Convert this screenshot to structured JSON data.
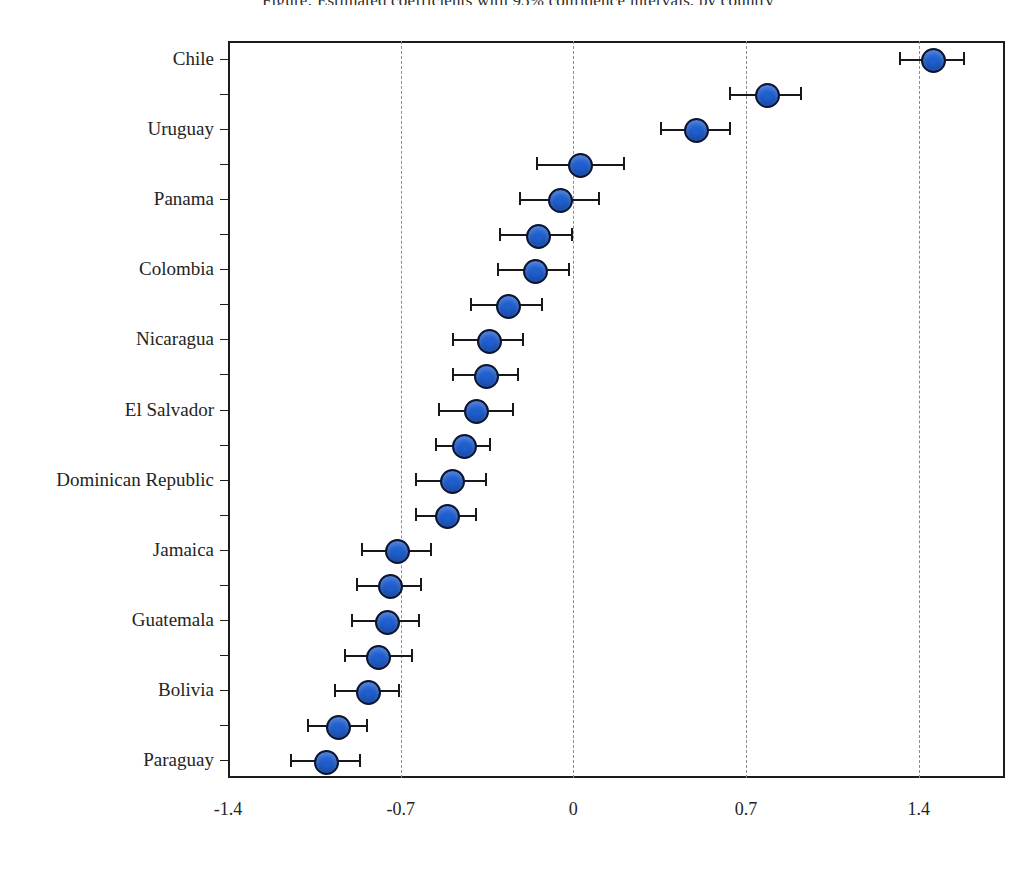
{
  "chart_data": {
    "type": "scatter",
    "title": "Figure: Estimated coefficients with 95% confidence intervals, by country",
    "xlabel": "",
    "ylabel": "",
    "xlim": [
      -1.4,
      1.75
    ],
    "xticks": [
      -1.4,
      -0.7,
      0,
      0.7,
      1.4
    ],
    "xticklabels": [
      "-1.4",
      "-0.7",
      "0",
      "0.7",
      "1.4"
    ],
    "grid": "vertical-dashed",
    "legend": "none",
    "orientation": "horizontal",
    "marker_color": "#1F5FD0",
    "marker_edge_color": "#0D1430",
    "errorbar_color": "#16181C",
    "categories": [
      "Chile",
      "",
      "Uruguay",
      "",
      "Panama",
      "",
      "Colombia",
      "",
      "Nicaragua",
      "",
      "El Salvador",
      "",
      "Dominican Republic",
      "",
      "Jamaica",
      "",
      "Guatemala",
      "",
      "Bolivia",
      "",
      "Paraguay"
    ],
    "labeled_categories": [
      "Chile",
      "Uruguay",
      "Panama",
      "Colombia",
      "Nicaragua",
      "El Salvador",
      "Dominican Republic",
      "Jamaica",
      "Guatemala",
      "Bolivia",
      "Paraguay"
    ],
    "points": [
      {
        "label": "Chile",
        "value": 1.45,
        "low": 1.32,
        "high": 1.58,
        "labeled": true
      },
      {
        "label": "",
        "value": 0.78,
        "low": 0.63,
        "high": 0.92,
        "labeled": false
      },
      {
        "label": "Uruguay",
        "value": 0.49,
        "low": 0.35,
        "high": 0.63,
        "labeled": true
      },
      {
        "label": "",
        "value": 0.02,
        "low": -0.15,
        "high": 0.2,
        "labeled": false
      },
      {
        "label": "Panama",
        "value": -0.06,
        "low": -0.22,
        "high": 0.1,
        "labeled": true
      },
      {
        "label": "",
        "value": -0.15,
        "low": -0.3,
        "high": -0.01,
        "labeled": false
      },
      {
        "label": "Colombia",
        "value": -0.16,
        "low": -0.31,
        "high": -0.02,
        "labeled": true
      },
      {
        "label": "",
        "value": -0.27,
        "low": -0.42,
        "high": -0.13,
        "labeled": false
      },
      {
        "label": "Nicaragua",
        "value": -0.35,
        "low": -0.49,
        "high": -0.21,
        "labeled": true
      },
      {
        "label": "",
        "value": -0.36,
        "low": -0.49,
        "high": -0.23,
        "labeled": false
      },
      {
        "label": "El Salvador",
        "value": -0.4,
        "low": -0.55,
        "high": -0.25,
        "labeled": true
      },
      {
        "label": "",
        "value": -0.45,
        "low": -0.56,
        "high": -0.34,
        "labeled": false
      },
      {
        "label": "Dominican Republic",
        "value": -0.5,
        "low": -0.64,
        "high": -0.36,
        "labeled": true
      },
      {
        "label": "",
        "value": -0.52,
        "low": -0.64,
        "high": -0.4,
        "labeled": false
      },
      {
        "label": "Jamaica",
        "value": -0.72,
        "low": -0.86,
        "high": -0.58,
        "labeled": true
      },
      {
        "label": "",
        "value": -0.75,
        "low": -0.88,
        "high": -0.62,
        "labeled": false
      },
      {
        "label": "Guatemala",
        "value": -0.76,
        "low": -0.9,
        "high": -0.63,
        "labeled": true
      },
      {
        "label": "",
        "value": -0.8,
        "low": -0.93,
        "high": -0.66,
        "labeled": false
      },
      {
        "label": "Bolivia",
        "value": -0.84,
        "low": -0.97,
        "high": -0.71,
        "labeled": true
      },
      {
        "label": "",
        "value": -0.96,
        "low": -1.08,
        "high": -0.84,
        "labeled": false
      },
      {
        "label": "Paraguay",
        "value": -1.01,
        "low": -1.15,
        "high": -0.87,
        "labeled": true
      }
    ]
  }
}
